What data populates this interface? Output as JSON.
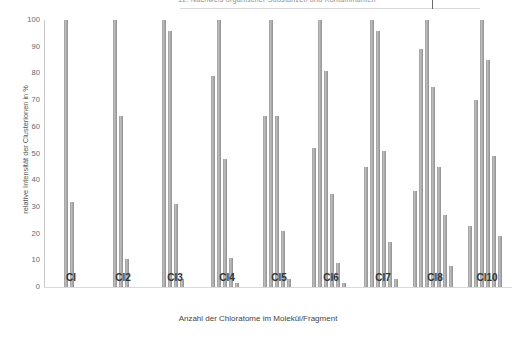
{
  "header": {
    "clipped_text": "12. Nachweis organischer Substanzen und Kontaminanten",
    "note": "top line of text is cut off by the screenshot crop"
  },
  "chart_data": {
    "type": "bar",
    "title": "",
    "xlabel": "Anzahl der Chloratome im Molekül/Fragment",
    "ylabel": "relative Intensität der Clusterionen in %",
    "ylim": [
      0,
      100
    ],
    "ytick_labels": [
      "100",
      "90",
      "80",
      "70",
      "60",
      "50",
      "40",
      "30",
      "20",
      "10",
      "0"
    ],
    "yticks": [
      100,
      90,
      80,
      70,
      60,
      50,
      40,
      30,
      20,
      10,
      0
    ],
    "grid": false,
    "legend": "none",
    "bar_color": "#a8a8a8",
    "categories": [
      "Cl",
      "Cl2",
      "Cl3",
      "Cl4",
      "Cl5",
      "Cl6",
      "Cl7",
      "Cl8",
      "Cl10"
    ],
    "groups": [
      {
        "label": "Cl",
        "values": [
          100,
          32
        ]
      },
      {
        "label": "Cl2",
        "values": [
          100,
          64,
          10.5
        ]
      },
      {
        "label": "Cl3",
        "values": [
          100,
          96,
          31,
          3
        ]
      },
      {
        "label": "Cl4",
        "values": [
          79,
          100,
          48,
          11,
          1.5
        ]
      },
      {
        "label": "Cl5",
        "values": [
          64,
          100,
          64,
          21,
          3
        ]
      },
      {
        "label": "Cl6",
        "values": [
          52,
          100,
          81,
          35,
          9,
          1.5
        ]
      },
      {
        "label": "Cl7",
        "values": [
          45,
          100,
          96,
          51,
          17,
          3
        ]
      },
      {
        "label": "Cl8",
        "values": [
          36,
          89,
          100,
          75,
          45,
          27,
          8
        ]
      },
      {
        "label": "Cl10",
        "values": [
          23,
          70,
          100,
          85,
          49,
          19
        ]
      }
    ]
  }
}
